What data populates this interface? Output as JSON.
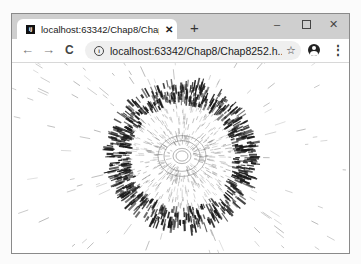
{
  "window": {
    "controls": {
      "minimize": "–",
      "maximize": "",
      "close": "✕"
    }
  },
  "tab": {
    "favicon_text": "IJ",
    "title": "localhost:63342/Chap8/ChapE",
    "close_glyph": "✕",
    "new_tab_glyph": "+"
  },
  "toolbar": {
    "back_glyph": "←",
    "forward_glyph": "→",
    "reload_glyph": "C",
    "info_glyph": "i",
    "url": "localhost:63342/Chap8/Chap8252.h...",
    "star_glyph": "☆",
    "menu_glyph": "⋮"
  },
  "canvas_art": {
    "type": "radial-line-burst",
    "center": [
      170,
      93
    ],
    "inner_ring_radius": 10,
    "dark_ring_radius": [
      50,
      76
    ],
    "colors": {
      "dark": "#1a1a1a",
      "mid": "#8c8c8c",
      "light": "#a8a8a8"
    },
    "line_counts": {
      "core": 500,
      "dark_ring": 700,
      "outer": 220
    },
    "seed": 8252
  }
}
